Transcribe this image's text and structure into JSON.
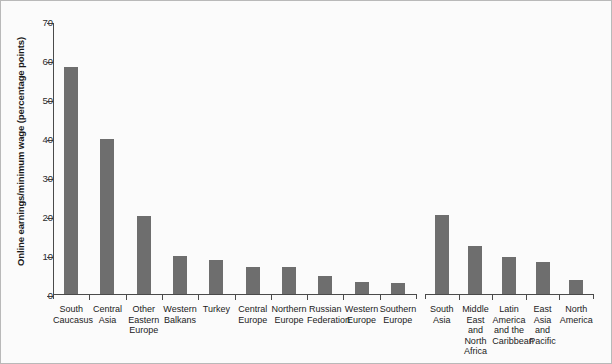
{
  "chart": {
    "type": "bar",
    "ylabel": "Online earnings/minimum wage (percentage points)",
    "title": "",
    "xlabel": "",
    "ylim": [
      0,
      70
    ],
    "yticks": [
      0,
      10,
      20,
      30,
      40,
      50,
      60,
      70
    ],
    "grid": false,
    "legend": null,
    "bar_color": "#6e6e6e",
    "axis_color": "#4a4a4a",
    "groups": [
      {
        "name": "europe-central-asia",
        "categories": [
          "South Caucasus",
          "Central Asia",
          "Other Eastern Europe",
          "Western Balkans",
          "Turkey",
          "Central Europe",
          "Northern Europe",
          "Russian Federation",
          "Western Europe",
          "Southern Europe"
        ],
        "values": [
          58.2,
          39.7,
          19.9,
          9.7,
          8.7,
          7.0,
          6.9,
          4.6,
          3.1,
          2.7
        ]
      },
      {
        "name": "other-regions",
        "categories": [
          "South Asia",
          "Middle East and North Africa",
          "Latin America and the Caribbean",
          "East Asia and Pacific",
          "North America"
        ],
        "values": [
          20.2,
          12.3,
          9.5,
          8.2,
          3.6
        ]
      }
    ]
  }
}
